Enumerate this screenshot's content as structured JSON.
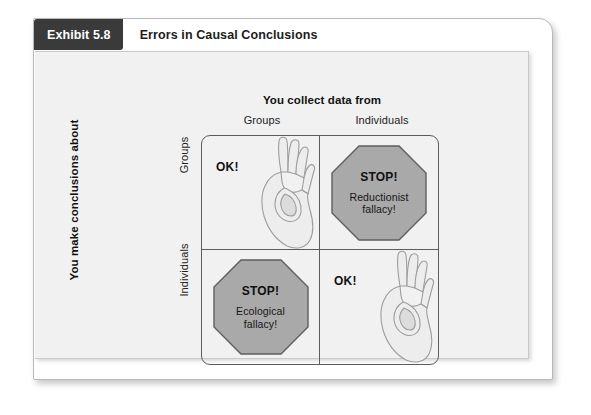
{
  "exhibit": {
    "tab_label": "Exhibit 5.8",
    "title": "Errors in Causal Conclusions"
  },
  "matrix": {
    "column_axis_label": "You collect data from",
    "column_headers": [
      "Groups",
      "Individuals"
    ],
    "row_axis_label": "You make conclusions about",
    "row_headers": [
      "Groups",
      "Individuals"
    ],
    "cells": {
      "top_left": {
        "verdict": "OK!",
        "icon": "ok-hand-icon"
      },
      "top_right": {
        "verdict": "STOP!",
        "fallacy_line1": "Reductionist",
        "fallacy_line2": "fallacy!",
        "icon": "stop-octagon-icon"
      },
      "bottom_left": {
        "verdict": "STOP!",
        "fallacy_line1": "Ecological",
        "fallacy_line2": "fallacy!",
        "icon": "stop-octagon-icon"
      },
      "bottom_right": {
        "verdict": "OK!",
        "icon": "ok-hand-icon"
      }
    }
  },
  "colors": {
    "tab_background": "#3a3a3a",
    "tab_text": "#ffffff",
    "panel_background": "#f1f1f1",
    "card_background": "#ffffff",
    "matrix_border": "#5c5c5c",
    "octagon_fill": "#a9a9a9",
    "octagon_stroke": "#5e5e5e",
    "hand_fill": "#eeeeee",
    "hand_stroke": "#9a9a9a"
  }
}
